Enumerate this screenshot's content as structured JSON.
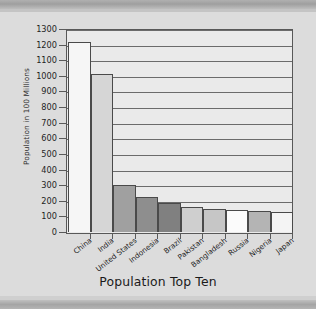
{
  "chart_data": {
    "type": "bar",
    "title": "",
    "xlabel": "Population Top Ten",
    "ylabel": "Population in 100 Millions",
    "categories": [
      "China",
      "India",
      "United States",
      "Indonesia",
      "Brazil",
      "Pakistan",
      "Bangladesh",
      "Russia",
      "Nigeria",
      "Japan"
    ],
    "values": [
      1220,
      1015,
      300,
      225,
      185,
      163,
      148,
      140,
      133,
      127
    ],
    "ylim": [
      0,
      1300
    ],
    "ytick_labels": [
      "0",
      "100",
      "200",
      "300",
      "400",
      "500",
      "600",
      "700",
      "800",
      "900",
      "1000",
      "1100",
      "1200",
      "1300"
    ],
    "ytick_values": [
      0,
      100,
      200,
      300,
      400,
      500,
      600,
      700,
      800,
      900,
      1000,
      1100,
      1200,
      1300
    ],
    "grid": true,
    "legend": "none",
    "bar_colors": [
      "#f6f6f6",
      "#d6d6d6",
      "#a0a0a0",
      "#8e8e8e",
      "#808080",
      "#cfcfcf",
      "#c6c6c6",
      "#fbfbfb",
      "#b4b4b4",
      "#f4f4f4"
    ],
    "bar_edge_color": "#4a4a4a",
    "plot_background": "#eaeaea",
    "gridline_color": "#6b6b6b"
  }
}
